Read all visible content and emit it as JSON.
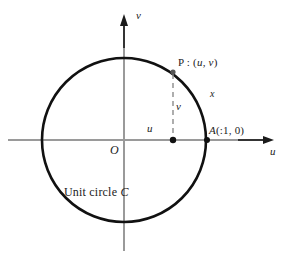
{
  "figure": {
    "type": "unit-circle-diagram",
    "caption_prefix": "Unit circle ",
    "caption_symbol": "C",
    "labels": {
      "v_axis": "v",
      "u_axis": "u",
      "origin": "O",
      "point_p_prefix": "P : (",
      "point_p_u": "u",
      "point_p_sep": ", ",
      "point_p_v": "v",
      "point_p_suffix": ")",
      "point_a_name": "A",
      "point_a_coords": "(:1, 0)",
      "arc_length": "x",
      "segment_v": "v",
      "segment_u": "u"
    },
    "colors": {
      "circle": "#111111",
      "axis": "#9a9a9a",
      "arrow": "#1b1b1b",
      "dashed": "#8c8c8c",
      "point": "#111111",
      "text": "#1b1b1b",
      "background": "#ffffff"
    },
    "geometry": {
      "center_x": 124,
      "center_y": 140,
      "radius": 82,
      "point_p_x": 173,
      "point_p_y": 72,
      "point_a_x": 207,
      "point_a_y": 140,
      "foot_x": 173,
      "foot_y": 140,
      "u_axis_start_x": 8,
      "u_axis_end_x": 274,
      "v_axis_top_y": 18,
      "v_axis_bottom_y": 251
    }
  }
}
